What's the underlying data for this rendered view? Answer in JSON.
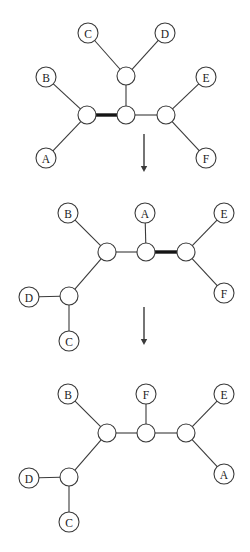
{
  "figure": {
    "background_color": "#ffffff",
    "line_color": "#3a3a3a",
    "thick_bond_color": "#141414",
    "node_fill": "#ffffff",
    "label_color": "#1a1a1a",
    "width": 250,
    "height": 552
  },
  "steps": [
    {
      "id": "step-1",
      "name": "graph-top",
      "backbone": [
        {
          "id": "b1",
          "x": 87,
          "y": 115,
          "r": 9
        },
        {
          "id": "b2",
          "x": 126,
          "y": 115,
          "r": 9
        },
        {
          "id": "b3",
          "x": 166,
          "y": 115,
          "r": 9
        },
        {
          "id": "b4",
          "x": 126,
          "y": 76,
          "r": 9
        }
      ],
      "labeled_nodes": [
        {
          "label": "A",
          "x": 46,
          "y": 158,
          "r": 10
        },
        {
          "label": "B",
          "x": 46,
          "y": 77,
          "r": 10
        },
        {
          "label": "C",
          "x": 88,
          "y": 33,
          "r": 10
        },
        {
          "label": "D",
          "x": 165,
          "y": 33,
          "r": 10
        },
        {
          "label": "E",
          "x": 206,
          "y": 77,
          "r": 10
        },
        {
          "label": "F",
          "x": 206,
          "y": 158,
          "r": 10
        }
      ],
      "edges": [
        {
          "from": "b1",
          "to": "b2",
          "style": "thick"
        },
        {
          "from": "b2",
          "to": "b3",
          "style": "thin"
        },
        {
          "from": "b2",
          "to": "b4",
          "style": "thin"
        },
        {
          "from": "b4",
          "to": "C",
          "style": "thin"
        },
        {
          "from": "b4",
          "to": "D",
          "style": "thin"
        },
        {
          "from": "b1",
          "to": "B",
          "style": "thin"
        },
        {
          "from": "b1",
          "to": "A",
          "style": "thin"
        },
        {
          "from": "b3",
          "to": "E",
          "style": "thin"
        },
        {
          "from": "b3",
          "to": "F",
          "style": "thin"
        }
      ]
    },
    {
      "id": "step-2",
      "name": "graph-middle",
      "backbone": [
        {
          "id": "c1",
          "x": 107,
          "y": 252,
          "r": 9
        },
        {
          "id": "c2",
          "x": 146,
          "y": 252,
          "r": 9
        },
        {
          "id": "c3",
          "x": 186,
          "y": 252,
          "r": 9
        },
        {
          "id": "c4",
          "x": 69,
          "y": 296,
          "r": 9
        }
      ],
      "labeled_nodes": [
        {
          "label": "B",
          "x": 68,
          "y": 213,
          "r": 10
        },
        {
          "label": "A",
          "x": 145,
          "y": 213,
          "r": 10
        },
        {
          "label": "E",
          "x": 224,
          "y": 213,
          "r": 10
        },
        {
          "label": "D",
          "x": 29,
          "y": 297,
          "r": 10
        },
        {
          "label": "F",
          "x": 224,
          "y": 293,
          "r": 10
        },
        {
          "label": "C",
          "x": 69,
          "y": 341,
          "r": 10
        }
      ],
      "edges": [
        {
          "from": "c1",
          "to": "c2",
          "style": "thin"
        },
        {
          "from": "c2",
          "to": "c3",
          "style": "thick"
        },
        {
          "from": "c1",
          "to": "B",
          "style": "thin"
        },
        {
          "from": "c2",
          "to": "A",
          "style": "thin"
        },
        {
          "from": "c3",
          "to": "E",
          "style": "thin"
        },
        {
          "from": "c3",
          "to": "F",
          "style": "thin"
        },
        {
          "from": "c1",
          "to": "c4",
          "style": "thin"
        },
        {
          "from": "c4",
          "to": "D",
          "style": "thin"
        },
        {
          "from": "c4",
          "to": "C",
          "style": "thin"
        }
      ]
    },
    {
      "id": "step-3",
      "name": "graph-bottom",
      "backbone": [
        {
          "id": "d1",
          "x": 107,
          "y": 433,
          "r": 9
        },
        {
          "id": "d2",
          "x": 146,
          "y": 433,
          "r": 9
        },
        {
          "id": "d3",
          "x": 186,
          "y": 433,
          "r": 9
        },
        {
          "id": "d4",
          "x": 69,
          "y": 477,
          "r": 9
        }
      ],
      "labeled_nodes": [
        {
          "label": "B",
          "x": 68,
          "y": 394,
          "r": 10
        },
        {
          "label": "F",
          "x": 146,
          "y": 394,
          "r": 10
        },
        {
          "label": "E",
          "x": 224,
          "y": 394,
          "r": 10
        },
        {
          "label": "D",
          "x": 29,
          "y": 478,
          "r": 10
        },
        {
          "label": "A",
          "x": 224,
          "y": 474,
          "r": 10
        },
        {
          "label": "C",
          "x": 69,
          "y": 522,
          "r": 10
        }
      ],
      "edges": [
        {
          "from": "d1",
          "to": "d2",
          "style": "thin"
        },
        {
          "from": "d2",
          "to": "d3",
          "style": "thin"
        },
        {
          "from": "d1",
          "to": "B",
          "style": "thin"
        },
        {
          "from": "d2",
          "to": "F",
          "style": "thin"
        },
        {
          "from": "d3",
          "to": "E",
          "style": "thin"
        },
        {
          "from": "d3",
          "to": "A",
          "style": "thin"
        },
        {
          "from": "d1",
          "to": "d4",
          "style": "thin"
        },
        {
          "from": "d4",
          "to": "D",
          "style": "thin"
        },
        {
          "from": "d4",
          "to": "C",
          "style": "thin"
        }
      ]
    }
  ],
  "arrows": [
    {
      "id": "arrow-1",
      "name": "down-arrow-icon",
      "x": 144,
      "y1": 134,
      "y2": 172
    },
    {
      "id": "arrow-2",
      "name": "down-arrow-icon",
      "x": 144,
      "y1": 307,
      "y2": 345
    }
  ]
}
